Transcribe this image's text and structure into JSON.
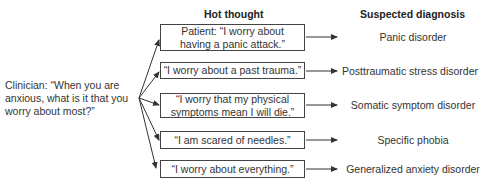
{
  "headers": {
    "hot_thought": "Hot thought",
    "suspected_diagnosis": "Suspected diagnosis"
  },
  "clinician": {
    "question": "Clinician: “When you are anxious, what is it that you worry about most?”"
  },
  "rows": [
    {
      "thought": "Patient: “I worry about\nhaving a panic attack.”",
      "diagnosis": "Panic disorder"
    },
    {
      "thought": "“I worry about a past trauma.”",
      "diagnosis": "Posttraumatic stress disorder"
    },
    {
      "thought": "“I worry that my physical\nsymptoms mean I will die.”",
      "diagnosis": "Somatic symptom disorder"
    },
    {
      "thought": "“I am scared of needles.”",
      "diagnosis": "Specific phobia"
    },
    {
      "thought": "“I worry about everything.”",
      "diagnosis": "Generalized anxiety disorder"
    }
  ],
  "colors": {
    "line": "#333333",
    "text": "#333333",
    "box_border": "#444444"
  }
}
